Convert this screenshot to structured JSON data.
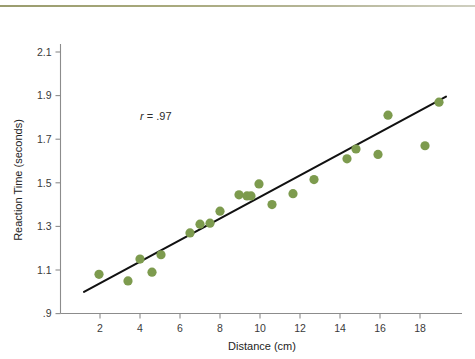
{
  "figure": {
    "background_color": "#ffffff",
    "top_rule_color": "#9a9c6e"
  },
  "chart_data": {
    "type": "scatter",
    "title": "",
    "xlabel": "Distance (cm)",
    "ylabel": "Reaction Time (seconds)",
    "xlim": [
      0.6,
      19.6
    ],
    "ylim": [
      0.9,
      2.2
    ],
    "xticks": [
      2,
      4,
      6,
      8,
      10,
      12,
      14,
      16,
      18
    ],
    "xticklabels": [
      "2",
      "4",
      "6",
      "8",
      "10",
      "12",
      "14",
      "16",
      "18"
    ],
    "yticks": [
      0.9,
      1.1,
      1.3,
      1.5,
      1.7,
      1.9,
      2.1
    ],
    "yticklabels": [
      ".9",
      "1.1",
      "1.3",
      "1.5",
      "1.7",
      "1.9",
      "2.1"
    ],
    "grid": false,
    "legend": false,
    "marker_color": "#7d9b4e",
    "marker_size": 7,
    "annotations": [
      {
        "name": "correlation-annotation",
        "text": "r = .97",
        "symbol": "r",
        "operator": "=",
        "value": ".97",
        "x": 4.0,
        "y": 1.79
      }
    ],
    "series": [
      {
        "name": "Reaction time observations",
        "type": "scatter",
        "color": "#7d9b4e",
        "points": [
          {
            "x": 1.95,
            "y": 1.08
          },
          {
            "x": 3.4,
            "y": 1.05
          },
          {
            "x": 4.0,
            "y": 1.15
          },
          {
            "x": 4.6,
            "y": 1.09
          },
          {
            "x": 5.05,
            "y": 1.17
          },
          {
            "x": 6.5,
            "y": 1.27
          },
          {
            "x": 7.0,
            "y": 1.31
          },
          {
            "x": 7.5,
            "y": 1.315
          },
          {
            "x": 8.0,
            "y": 1.37
          },
          {
            "x": 8.95,
            "y": 1.445
          },
          {
            "x": 9.35,
            "y": 1.44
          },
          {
            "x": 9.55,
            "y": 1.44
          },
          {
            "x": 9.95,
            "y": 1.495
          },
          {
            "x": 10.6,
            "y": 1.4
          },
          {
            "x": 11.65,
            "y": 1.45
          },
          {
            "x": 12.7,
            "y": 1.515
          },
          {
            "x": 14.35,
            "y": 1.61
          },
          {
            "x": 14.8,
            "y": 1.655
          },
          {
            "x": 15.9,
            "y": 1.63
          },
          {
            "x": 16.4,
            "y": 1.81
          },
          {
            "x": 18.25,
            "y": 1.67
          },
          {
            "x": 18.95,
            "y": 1.87
          }
        ]
      }
    ],
    "trendline": {
      "name": "best-fit-line",
      "type": "line",
      "color": "#111111",
      "x_start": 1.2,
      "y_start": 1.0,
      "x_end": 19.3,
      "y_end": 1.895
    }
  }
}
